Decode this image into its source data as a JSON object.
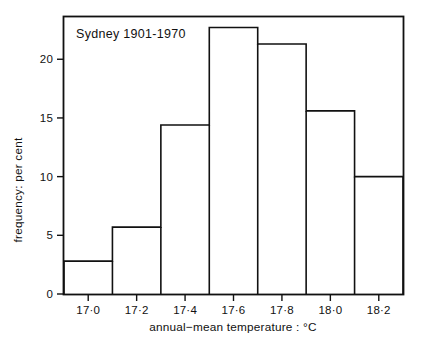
{
  "chart_data": {
    "type": "bar",
    "title": "Sydney 1901-1970",
    "xlabel": "annual−mean temperature : °C",
    "ylabel": "frequency: per cent",
    "grid": false,
    "legend": "none",
    "xlim": [
      16.9,
      18.3
    ],
    "ylim": [
      0,
      23.6
    ],
    "bin_width": 0.2,
    "bin_edges": [
      16.9,
      17.1,
      17.3,
      17.5,
      17.7,
      17.9,
      18.1,
      18.3,
      18.5
    ],
    "categories": [
      "16.9-17.1",
      "17.1-17.3",
      "17.3-17.5",
      "17.5-17.7",
      "17.7-17.9",
      "17.9-18.1",
      "18.1-18.3",
      "18.3-18.5"
    ],
    "values": [
      2.8,
      5.7,
      14.4,
      22.7,
      21.3,
      15.6,
      10.0,
      7.2
    ],
    "xticks": [
      17.0,
      17.2,
      17.4,
      17.6,
      17.8,
      18.0,
      18.2
    ],
    "xtick_labels": [
      "17·0",
      "17·2",
      "17·4",
      "17·6",
      "17·8",
      "18·0",
      "18·2"
    ],
    "yticks": [
      0,
      5,
      10,
      15,
      20
    ],
    "ytick_labels": [
      "0",
      "5",
      "10",
      "15",
      "20"
    ],
    "annotations": [
      "Sydney 1901-1970"
    ],
    "colors": {
      "line": "#111111",
      "fill": "#ffffff",
      "background": "#ffffff"
    }
  },
  "chart": {
    "title_text": "Sydney 1901-1970",
    "x_axis_title": "annual−mean temperature : °C",
    "y_axis_title": "frequency: per cent"
  }
}
